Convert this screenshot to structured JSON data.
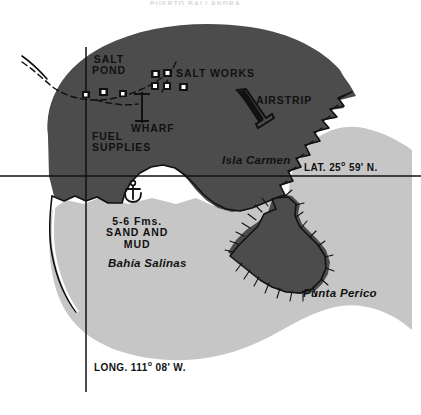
{
  "figure": {
    "kind": "nautical-chart-map",
    "title_partial": "PUERTO BALLANDRA",
    "width": 421,
    "height": 415
  },
  "colors": {
    "land": "#4c4c4c",
    "bay_water": "#c6c6c6",
    "background": "#ffffff",
    "coastline": "#111111",
    "text": "#111111",
    "graticule": "#111111"
  },
  "labels": {
    "salt_pond": "SALT\nPOND",
    "salt_works": "SALT WORKS",
    "wharf": "WHARF",
    "fuel_supplies": "FUEL\nSUPPLIES",
    "airstrip": "AIRSTRIP",
    "isla_carmen": "Isla Carmen",
    "depth_note": "5-6 Fms.\nSAND AND\nMUD",
    "bahia_salinas": "Bahía Salinas",
    "punta_perico": "Punta Perico"
  },
  "graticule": {
    "latitude_label_prefix": "LAT. 25",
    "latitude_label_suffix": " 59' N.",
    "latitude_degree_symbol": "o",
    "latitude_full": "LAT. 25o 59' N.",
    "longitude_label_prefix": "LONG. 111",
    "longitude_label_suffix": " 08' W.",
    "longitude_degree_symbol": "o",
    "longitude_full": "LONG. 111o 08' W."
  },
  "symbols": {
    "anchor": "anchor-symbol",
    "wharf_pier": "pier-symbol",
    "airstrip_runway": "runway-symbol",
    "salt_works_buildings": "building-squares",
    "cliff_hachures": "cliff-hachure-marks",
    "salt_pond_boundary": "dashed-boundary-line"
  }
}
